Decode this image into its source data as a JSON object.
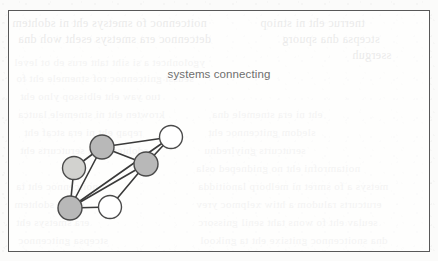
{
  "figure": {
    "title": "systems connecting",
    "frame": {
      "x": 8,
      "y": 10,
      "width": 422,
      "height": 242,
      "border_color": "#585858"
    },
    "background_color": "#fbfbfa",
    "title_color": "#6e6e6e"
  },
  "graph": {
    "type": "node-link-diagram",
    "edge_color": "#3a3a3a",
    "edge_width": 1.6,
    "node_stroke_color": "#4a4a4a",
    "node_radius": 11.5,
    "nodes": [
      {
        "id": "A",
        "label": "node-a",
        "x": 101,
        "y": 146,
        "radius": 12,
        "fill": "#b8b8b8",
        "shade": "dark-gray"
      },
      {
        "id": "B",
        "label": "node-b",
        "x": 73,
        "y": 167,
        "radius": 11.5,
        "fill": "#d2d2cf",
        "shade": "light-gray"
      },
      {
        "id": "C",
        "label": "node-c",
        "x": 170,
        "y": 136,
        "radius": 11.5,
        "fill": "#ffffff",
        "shade": "white"
      },
      {
        "id": "D",
        "label": "node-d",
        "x": 145,
        "y": 163,
        "radius": 12,
        "fill": "#b8b8b8",
        "shade": "dark-gray"
      },
      {
        "id": "E",
        "label": "node-e",
        "x": 69,
        "y": 207,
        "radius": 12,
        "fill": "#b8b8b8",
        "shade": "dark-gray"
      },
      {
        "id": "F",
        "label": "node-f",
        "x": 109,
        "y": 206,
        "radius": 11.5,
        "fill": "#ffffff",
        "shade": "white"
      }
    ],
    "edges": [
      {
        "from": "A",
        "to": "C"
      },
      {
        "from": "A",
        "to": "D"
      },
      {
        "from": "A",
        "to": "B"
      },
      {
        "from": "A",
        "to": "E"
      },
      {
        "from": "B",
        "to": "E"
      },
      {
        "from": "C",
        "to": "D"
      },
      {
        "from": "C",
        "to": "E"
      },
      {
        "from": "D",
        "to": "E"
      },
      {
        "from": "D",
        "to": "F"
      },
      {
        "from": "E",
        "to": "F"
      }
    ]
  },
  "background_showthrough": {
    "description": "faint mirrored bleed-through text from reverse of scanned page",
    "lines": [
      {
        "x": 12,
        "y": 16,
        "size": 12,
        "text": "noitcennoc fo smetsys eht ni sdohtem",
        "strong": true
      },
      {
        "x": 18,
        "y": 32,
        "size": 12,
        "text": "detcennoc era smetsys eseht woh dna",
        "strong": true
      },
      {
        "x": 260,
        "y": 16,
        "size": 12,
        "text": "tnerruc eht ni stniop",
        "strong": true
      },
      {
        "x": 282,
        "y": 32,
        "size": 12,
        "text": "stcepsa dna spuorg",
        "strong": true
      },
      {
        "x": 352,
        "y": 48,
        "size": 12,
        "text": "sserguh",
        "strong": true
      },
      {
        "x": 14,
        "y": 56,
        "size": 11,
        "text": "ygolonhcet a si siht taht erus eb ot level",
        "strong": false
      },
      {
        "x": 16,
        "y": 72,
        "size": 11,
        "text": "seussi gnitcennoc rof stnemele eht fo",
        "strong": false
      },
      {
        "x": 20,
        "y": 90,
        "size": 11,
        "text": "tuo yaw eht elbissop ylno eht",
        "strong": false
      },
      {
        "x": 18,
        "y": 108,
        "size": 11,
        "text": "krowten eht ni stnemele lautca",
        "strong": false
      },
      {
        "x": 24,
        "y": 126,
        "size": 11,
        "text": "repap eht ni era stcaf eht",
        "strong": false
      },
      {
        "x": 20,
        "y": 144,
        "size": 11,
        "text": "sdohtem dna serutcurts eht",
        "strong": false
      },
      {
        "x": 212,
        "y": 108,
        "size": 11,
        "text": "eht ni era stnemele dna",
        "strong": false
      },
      {
        "x": 208,
        "y": 126,
        "size": 11,
        "text": "sledom gnitcennoc eht",
        "strong": false
      },
      {
        "x": 204,
        "y": 144,
        "size": 11,
        "text": "serutcurts gniylrednu",
        "strong": false
      },
      {
        "x": 196,
        "y": 162,
        "size": 11,
        "text": "noitamrofni eht no gnidneped osla",
        "strong": false
      },
      {
        "x": 198,
        "y": 180,
        "size": 11,
        "text": "metsys a fo smret ni melborp lanoitidda",
        "strong": false
      },
      {
        "x": 196,
        "y": 198,
        "size": 11,
        "text": "erutcurts raludom a htiw xelpmoc yrev",
        "strong": false
      },
      {
        "x": 198,
        "y": 216,
        "size": 11,
        "text": "seulav eht fo wons taht senil gnissorc",
        "strong": false
      },
      {
        "x": 200,
        "y": 234,
        "size": 11,
        "text": "dna snoitcennoc gnitsixe eht ta gnikool",
        "strong": false
      },
      {
        "x": 16,
        "y": 180,
        "size": 11,
        "text": "noitcennoc eht ta",
        "strong": false
      },
      {
        "x": 14,
        "y": 198,
        "size": 11,
        "text": "eht ni sdohtem",
        "strong": false
      },
      {
        "x": 16,
        "y": 216,
        "size": 11,
        "text": "era smetsys eht",
        "strong": false
      },
      {
        "x": 18,
        "y": 234,
        "size": 11,
        "text": "stcepsa gnitcennoc",
        "strong": false
      }
    ]
  }
}
